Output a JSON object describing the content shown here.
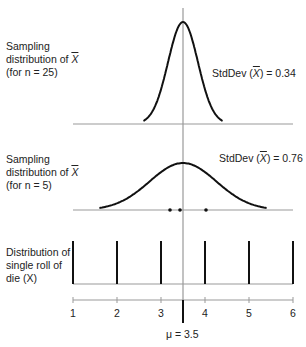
{
  "panels": [
    {
      "id": "n25",
      "label_lines": [
        "Sampling",
        "distribution of",
        "(for n = 25)"
      ],
      "label_var": "X",
      "stddev_prefix": "StdDev (",
      "stddev_var": "X",
      "stddev_suffix": ") = 0.34"
    },
    {
      "id": "n5",
      "label_lines": [
        "Sampling",
        "distribution of",
        "(for n = 5)"
      ],
      "label_var": "X",
      "stddev_prefix": "StdDev (",
      "stddev_var": "X",
      "stddev_suffix": ") = 0.76"
    },
    {
      "id": "die",
      "label_lines": [
        "Distribution of",
        "single roll of",
        "die (X)"
      ]
    }
  ],
  "axis": {
    "ticks": [
      "1",
      "2",
      "3",
      "4",
      "5",
      "6"
    ],
    "mean_label": "μ = 3.5"
  },
  "chart_data": {
    "type": "diagram",
    "title": "",
    "mean": 3.5,
    "x_range": [
      1,
      6
    ],
    "die_distribution": {
      "values": [
        1,
        2,
        3,
        4,
        5,
        6
      ],
      "probabilities": [
        0.1667,
        0.1667,
        0.1667,
        0.1667,
        0.1667,
        0.1667
      ]
    },
    "sampling_n5": {
      "mean": 3.5,
      "stddev": 0.76,
      "sample_points": [
        3.2,
        3.4,
        4.0
      ]
    },
    "sampling_n25": {
      "mean": 3.5,
      "stddev": 0.34
    }
  }
}
